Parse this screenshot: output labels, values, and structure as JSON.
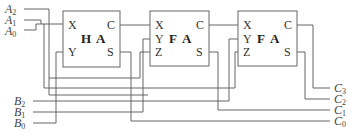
{
  "diagram": {
    "inputs_a": [
      {
        "name": "A",
        "sub": "2"
      },
      {
        "name": "A",
        "sub": "1"
      },
      {
        "name": "A",
        "sub": "0"
      }
    ],
    "inputs_b": [
      {
        "name": "B",
        "sub": "2"
      },
      {
        "name": "B",
        "sub": "1"
      },
      {
        "name": "B",
        "sub": "0"
      }
    ],
    "outputs_c": [
      {
        "name": "C",
        "sub": "3"
      },
      {
        "name": "C",
        "sub": "2"
      },
      {
        "name": "C",
        "sub": "1"
      },
      {
        "name": "C",
        "sub": "0"
      }
    ],
    "blocks": [
      {
        "title_a": "H",
        "title_b": "A",
        "ports_left": [
          "X",
          "Y"
        ],
        "ports_right": [
          "C",
          "S"
        ]
      },
      {
        "title_a": "F",
        "title_b": "A",
        "ports_left": [
          "X",
          "Y",
          "Z"
        ],
        "ports_right": [
          "C",
          "S"
        ]
      },
      {
        "title_a": "F",
        "title_b": "A",
        "ports_left": [
          "X",
          "Y",
          "Z"
        ],
        "ports_right": [
          "C",
          "S"
        ]
      }
    ]
  }
}
